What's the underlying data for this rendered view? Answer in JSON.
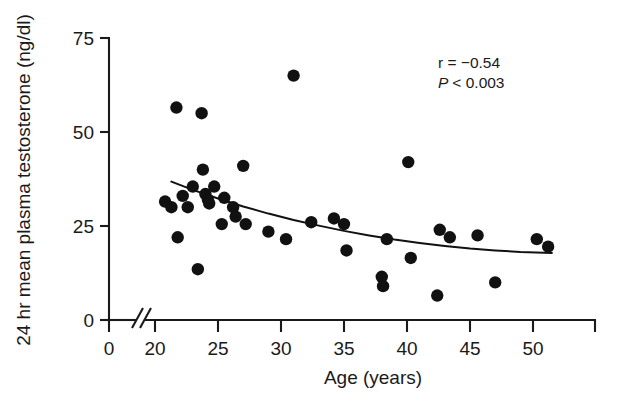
{
  "chart_data": {
    "type": "scatter",
    "title": "",
    "xlabel": "Age (years)",
    "ylabel": "24 hr mean plasma testosterone (ng/dl)",
    "xlim": [
      20,
      52
    ],
    "ylim": [
      0,
      75
    ],
    "xticks": [
      0,
      20,
      25,
      30,
      35,
      40,
      45,
      50
    ],
    "xtick_labels": [
      "0",
      "20",
      "25",
      "30",
      "35",
      "40",
      "45",
      "50"
    ],
    "yticks": [
      0,
      25,
      50,
      75
    ],
    "ytick_labels": [
      "0",
      "25",
      "50",
      "75"
    ],
    "axis_break": true,
    "axis_break_note": "x-axis broken between 0 and 20",
    "grid": false,
    "legend": null,
    "marker": "filled-circle",
    "points": [
      {
        "x": 20.8,
        "y": 31.5
      },
      {
        "x": 21.3,
        "y": 30.0
      },
      {
        "x": 21.7,
        "y": 56.5
      },
      {
        "x": 21.8,
        "y": 22.0
      },
      {
        "x": 22.2,
        "y": 33.0
      },
      {
        "x": 22.6,
        "y": 30.0
      },
      {
        "x": 23.0,
        "y": 35.5
      },
      {
        "x": 23.4,
        "y": 13.5
      },
      {
        "x": 23.7,
        "y": 55.0
      },
      {
        "x": 23.8,
        "y": 40.0
      },
      {
        "x": 24.0,
        "y": 33.5
      },
      {
        "x": 24.2,
        "y": 32.0
      },
      {
        "x": 24.3,
        "y": 31.0
      },
      {
        "x": 24.7,
        "y": 35.5
      },
      {
        "x": 25.3,
        "y": 25.5
      },
      {
        "x": 25.5,
        "y": 32.5
      },
      {
        "x": 26.2,
        "y": 30.0
      },
      {
        "x": 26.4,
        "y": 27.5
      },
      {
        "x": 27.0,
        "y": 41.0
      },
      {
        "x": 27.2,
        "y": 25.5
      },
      {
        "x": 29.0,
        "y": 23.5
      },
      {
        "x": 30.4,
        "y": 21.5
      },
      {
        "x": 31.0,
        "y": 65.0
      },
      {
        "x": 32.4,
        "y": 26.0
      },
      {
        "x": 34.2,
        "y": 27.0
      },
      {
        "x": 35.0,
        "y": 25.5
      },
      {
        "x": 35.2,
        "y": 18.5
      },
      {
        "x": 38.0,
        "y": 11.5
      },
      {
        "x": 38.1,
        "y": 9.0
      },
      {
        "x": 38.4,
        "y": 21.5
      },
      {
        "x": 40.1,
        "y": 42.0
      },
      {
        "x": 40.3,
        "y": 16.5
      },
      {
        "x": 42.4,
        "y": 6.5
      },
      {
        "x": 42.6,
        "y": 24.0
      },
      {
        "x": 43.4,
        "y": 22.0
      },
      {
        "x": 45.6,
        "y": 22.5
      },
      {
        "x": 47.0,
        "y": 10.0
      },
      {
        "x": 50.3,
        "y": 21.5
      },
      {
        "x": 51.2,
        "y": 19.5
      }
    ],
    "fit_curve": {
      "type": "exponential-decay-fit",
      "points": [
        {
          "x": 21.3,
          "y": 36.8
        },
        {
          "x": 23.0,
          "y": 34.6
        },
        {
          "x": 25.0,
          "y": 32.3
        },
        {
          "x": 27.0,
          "y": 30.2
        },
        {
          "x": 29.0,
          "y": 28.3
        },
        {
          "x": 31.0,
          "y": 26.6
        },
        {
          "x": 33.0,
          "y": 25.1
        },
        {
          "x": 35.0,
          "y": 23.7
        },
        {
          "x": 37.0,
          "y": 22.5
        },
        {
          "x": 39.0,
          "y": 21.4
        },
        {
          "x": 41.0,
          "y": 20.5
        },
        {
          "x": 43.0,
          "y": 19.7
        },
        {
          "x": 45.0,
          "y": 19.0
        },
        {
          "x": 47.0,
          "y": 18.5
        },
        {
          "x": 49.0,
          "y": 18.1
        },
        {
          "x": 51.5,
          "y": 17.8
        }
      ]
    },
    "annotations": {
      "correlation_line": "r = −0.54",
      "correlation_symbol": "r",
      "correlation_value": "−0.54",
      "pvalue_symbol": "P",
      "pvalue_value": "< 0.003",
      "pvalue_line": "P < 0.003"
    },
    "colors": {
      "marker": "#111111",
      "curve": "#111111",
      "axis": "#1a1a1a",
      "background": "#ffffff"
    }
  }
}
